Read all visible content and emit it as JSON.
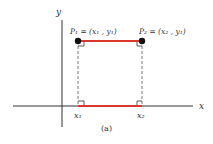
{
  "figure": {
    "caption": "(a)",
    "axes": {
      "x_label": "x",
      "y_label": "y"
    },
    "points": [
      {
        "name": "P1",
        "label": "P₁ = (x₁ , y₁)"
      },
      {
        "name": "P2",
        "label": "P₂ = (x₂ , y₁)"
      }
    ],
    "ticks": {
      "x1": "x₁",
      "x2": "x₂"
    },
    "colors": {
      "segment": "#d9382e",
      "axis": "#333333",
      "point": "#111111"
    }
  }
}
